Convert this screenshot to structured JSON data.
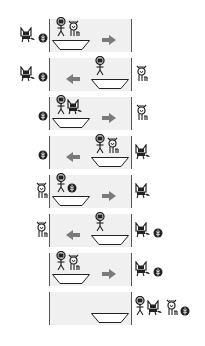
{
  "puzzle": "river-crossing",
  "characters": {
    "farmer": "farmer-icon",
    "wolf": "wolf-icon",
    "goat": "goat-icon",
    "cabbage": "cabbage-icon"
  },
  "colors": {
    "river": "#f0f0f0",
    "bank_line": "#555555",
    "arrow": "#7a7a7a",
    "ink": "#222222"
  },
  "rows": [
    {
      "left": [
        "wolf",
        "cabbage"
      ],
      "boat_side": "left",
      "boat": [
        "farmer",
        "goat"
      ],
      "arrow": "right",
      "right": []
    },
    {
      "left": [
        "wolf",
        "cabbage"
      ],
      "boat_side": "right",
      "boat": [
        "farmer"
      ],
      "arrow": "left",
      "right": [
        "goat"
      ]
    },
    {
      "left": [
        "cabbage"
      ],
      "boat_side": "left",
      "boat": [
        "farmer",
        "wolf"
      ],
      "arrow": "right",
      "right": [
        "goat"
      ]
    },
    {
      "left": [
        "cabbage"
      ],
      "boat_side": "right",
      "boat": [
        "farmer",
        "goat"
      ],
      "arrow": "left",
      "right": [
        "wolf"
      ]
    },
    {
      "left": [
        "goat"
      ],
      "boat_side": "left",
      "boat": [
        "farmer",
        "cabbage"
      ],
      "arrow": "right",
      "right": [
        "wolf"
      ]
    },
    {
      "left": [
        "goat"
      ],
      "boat_side": "right",
      "boat": [
        "farmer"
      ],
      "arrow": "left",
      "right": [
        "wolf",
        "cabbage"
      ]
    },
    {
      "left": [],
      "boat_side": "left",
      "boat": [
        "farmer",
        "goat"
      ],
      "arrow": "right",
      "right": [
        "wolf",
        "cabbage"
      ]
    },
    {
      "left": [],
      "boat_side": "right",
      "boat": [],
      "arrow": "none",
      "right": [
        "farmer",
        "wolf",
        "goat",
        "cabbage"
      ]
    }
  ]
}
